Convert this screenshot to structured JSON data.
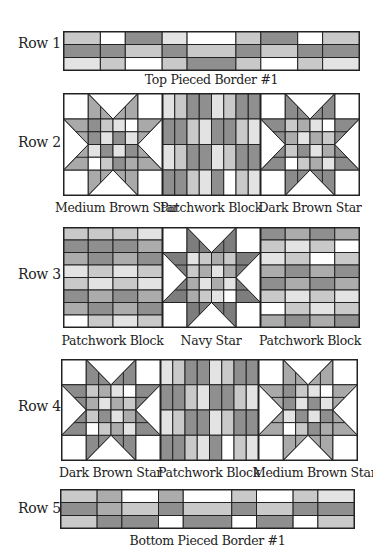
{
  "palette": {
    "W": "#ffffff",
    "L": "#e3e3e3",
    "S": "#c9c9c9",
    "M": "#acacac",
    "D": "#8f8f8f",
    "line": "#222222"
  },
  "rows": [
    {
      "label": "Row 1",
      "captions": [
        "Top Pieced Border #1"
      ]
    },
    {
      "label": "Row 2",
      "captions": [
        "Medium Brown Star",
        "Patchwork Block",
        "Dark Brown Star"
      ]
    },
    {
      "label": "Row 3",
      "captions": [
        "Patchwork Block",
        "Navy Star",
        "Patchwork Block"
      ]
    },
    {
      "label": "Row 4",
      "captions": [
        "Dark Brown Star",
        "Patchwork Block",
        "Medium Brown Star"
      ]
    },
    {
      "label": "Row 5",
      "captions": [
        "Bottom Pieced Border #1"
      ]
    }
  ],
  "borders": {
    "top": {
      "col_widths": [
        37,
        25,
        37,
        25,
        49,
        25,
        37,
        25,
        37
      ],
      "rows": [
        [
          "S",
          "W",
          "D",
          "L",
          "W",
          "S",
          "D",
          "W",
          "S"
        ],
        [
          "D",
          "D",
          "S",
          "D",
          "S",
          "D",
          "S",
          "D",
          "D"
        ],
        [
          "L",
          "S",
          "W",
          "S",
          "D",
          "S",
          "W",
          "S",
          "L"
        ]
      ]
    },
    "bottom": {
      "col_widths": [
        37,
        25,
        37,
        25,
        49,
        25,
        37,
        25,
        37
      ],
      "rows": [
        [
          "S",
          "M",
          "W",
          "M",
          "W",
          "S",
          "W",
          "S",
          "L"
        ],
        [
          "D",
          "M",
          "S",
          "D",
          "S",
          "D",
          "S",
          "D",
          "D"
        ],
        [
          "S",
          "D",
          "D",
          "W",
          "D",
          "W",
          "D",
          "W",
          "S"
        ]
      ]
    }
  },
  "stars": {
    "medium_brown": {
      "point": "#a9a9a9",
      "center": [
        [
          "D",
          "S",
          "L",
          "W"
        ],
        [
          "D",
          "L",
          "D",
          "L"
        ],
        [
          "L",
          "D",
          "L",
          "D"
        ],
        [
          "W",
          "S",
          "D",
          "M"
        ]
      ]
    },
    "dark_brown": {
      "point": "#8c8c8c",
      "center": [
        [
          "S",
          "M",
          "L",
          "W"
        ],
        [
          "M",
          "L",
          "M",
          "S"
        ],
        [
          "S",
          "D",
          "L",
          "M"
        ],
        [
          "W",
          "S",
          "M",
          "L"
        ]
      ]
    },
    "navy": {
      "point": "#7d7d7d",
      "center": [
        [
          "L",
          "S",
          "M",
          "S"
        ],
        [
          "S",
          "M",
          "L",
          "M"
        ],
        [
          "M",
          "L",
          "M",
          "L"
        ],
        [
          "M",
          "S",
          "L",
          "W"
        ]
      ]
    }
  },
  "patchwork_vertical": {
    "rows": [
      [
        "L",
        "S",
        "D",
        "D",
        "L",
        "S",
        "D",
        "D"
      ],
      [
        "D",
        "D",
        "S",
        "L",
        "D",
        "D",
        "S",
        "L"
      ],
      [
        "L",
        "S",
        "D",
        "D",
        "L",
        "S",
        "D",
        "D"
      ],
      [
        "D",
        "D",
        "S",
        "L",
        "D",
        "W",
        "S",
        "L"
      ]
    ]
  },
  "patchwork_horizontal_a": {
    "rows": [
      [
        "S",
        "S",
        "S",
        "L"
      ],
      [
        "D",
        "D",
        "D",
        "M"
      ],
      [
        "M",
        "D",
        "M",
        "D"
      ],
      [
        "L",
        "S",
        "L",
        "S"
      ],
      [
        "S",
        "L",
        "S",
        "L"
      ],
      [
        "D",
        "M",
        "D",
        "M"
      ],
      [
        "M",
        "D",
        "M",
        "D"
      ],
      [
        "W",
        "S",
        "L",
        "S"
      ]
    ]
  },
  "patchwork_horizontal_b": {
    "rows": [
      [
        "D",
        "M",
        "D",
        "M"
      ],
      [
        "S",
        "L",
        "S",
        "W"
      ],
      [
        "L",
        "S",
        "W",
        "S"
      ],
      [
        "M",
        "D",
        "M",
        "D"
      ],
      [
        "D",
        "M",
        "D",
        "M"
      ],
      [
        "S",
        "L",
        "S",
        "L"
      ],
      [
        "W",
        "S",
        "L",
        "S"
      ],
      [
        "M",
        "D",
        "M",
        "D"
      ]
    ]
  }
}
